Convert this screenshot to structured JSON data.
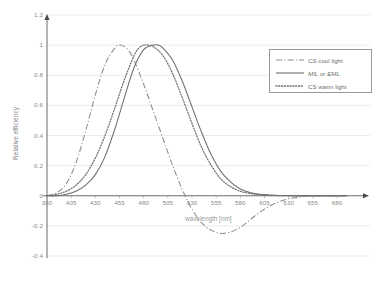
{
  "chart_data": {
    "type": "line",
    "title": "",
    "xlabel": "wavelength [nm]",
    "ylabel": "Relative efficiency",
    "xlim": [
      380,
      690
    ],
    "ylim": [
      -0.4,
      1.2
    ],
    "grid": true,
    "legend_position": "upper-right",
    "xticks": [
      "380",
      "405",
      "430",
      "455",
      "480",
      "505",
      "530",
      "555",
      "580",
      "605",
      "630",
      "655",
      "680"
    ],
    "yticks": [
      "1.2",
      "1",
      "0.8",
      "0.6",
      "0.4",
      "0.2",
      "0",
      "-0.2",
      "-0.4"
    ],
    "series": [
      {
        "name": "CS cool light",
        "style": "dash-dot",
        "color": "#8c8c8c",
        "x": [
          380,
          390,
          400,
          410,
          420,
          430,
          440,
          450,
          455,
          460,
          465,
          470,
          480,
          490,
          500,
          510,
          520,
          530,
          540,
          550,
          560,
          570,
          580,
          590,
          600,
          610,
          620,
          630,
          640,
          650,
          660,
          670,
          680,
          690
        ],
        "values": [
          0.0,
          0.02,
          0.08,
          0.22,
          0.43,
          0.67,
          0.87,
          0.98,
          1.0,
          0.99,
          0.96,
          0.9,
          0.74,
          0.56,
          0.38,
          0.2,
          0.04,
          -0.09,
          -0.18,
          -0.23,
          -0.25,
          -0.24,
          -0.21,
          -0.16,
          -0.11,
          -0.07,
          -0.04,
          -0.02,
          -0.01,
          0.0,
          0.0,
          0.0,
          0.0,
          0.0
        ]
      },
      {
        "name": "MIL or EML",
        "style": "solid",
        "color": "#6e6e6e",
        "x": [
          380,
          390,
          400,
          410,
          420,
          430,
          440,
          450,
          460,
          470,
          480,
          490,
          495,
          500,
          510,
          520,
          530,
          540,
          550,
          560,
          570,
          580,
          590,
          600,
          610,
          620,
          630,
          640,
          650,
          660,
          670,
          680,
          690
        ],
        "values": [
          0.0,
          0.0,
          0.01,
          0.03,
          0.07,
          0.14,
          0.26,
          0.44,
          0.65,
          0.85,
          0.97,
          1.0,
          1.0,
          0.98,
          0.9,
          0.76,
          0.59,
          0.42,
          0.27,
          0.16,
          0.09,
          0.045,
          0.022,
          0.01,
          0.005,
          0.002,
          0.001,
          0.0,
          0.0,
          0.0,
          0.0,
          0.0,
          0.0
        ]
      },
      {
        "name": "CS warm light",
        "style": "dotted",
        "color": "#6e6e6e",
        "x": [
          380,
          390,
          400,
          410,
          420,
          430,
          440,
          450,
          460,
          470,
          475,
          480,
          485,
          490,
          500,
          510,
          520,
          530,
          540,
          550,
          560,
          570,
          580,
          590,
          600,
          610,
          620,
          630,
          640,
          650,
          660,
          670,
          680,
          690
        ],
        "values": [
          0.0,
          0.01,
          0.03,
          0.07,
          0.14,
          0.25,
          0.4,
          0.58,
          0.77,
          0.93,
          0.98,
          1.0,
          1.0,
          0.99,
          0.93,
          0.81,
          0.65,
          0.48,
          0.32,
          0.2,
          0.11,
          0.06,
          0.03,
          0.015,
          0.007,
          0.003,
          0.001,
          0.0,
          0.0,
          0.0,
          0.0,
          0.0,
          0.0,
          0.0
        ]
      }
    ]
  },
  "axes": {
    "x_title": "wavelength [nm]",
    "y_title": "Relative efficiency"
  },
  "legend": {
    "items": [
      {
        "label": "CS cool light",
        "style": "dash-dot"
      },
      {
        "label": "MIL or EML",
        "style": "solid"
      },
      {
        "label": "CS warm light",
        "style": "dotted"
      }
    ]
  }
}
